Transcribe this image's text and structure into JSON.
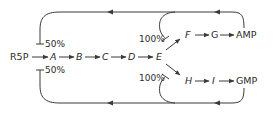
{
  "diagram": {
    "type": "metabolic-pathway-feedback",
    "colors": {
      "line": "#3a3a3a",
      "text": "#2a2a2a",
      "background": "#ffffff"
    },
    "nodes": {
      "r5p": "R5P",
      "a": "A",
      "b": "B",
      "c": "C",
      "d": "D",
      "e": "E",
      "f": "F",
      "g": "G",
      "amp": "AMP",
      "h": "H",
      "i": "I",
      "gmp": "GMP"
    },
    "labels": {
      "inhibit_a_top": "50%",
      "inhibit_a_bottom": "50%",
      "inhibit_f": "100%",
      "inhibit_h": "100%"
    },
    "edges": [
      {
        "from": "R5P",
        "to": "A"
      },
      {
        "from": "A",
        "to": "B"
      },
      {
        "from": "B",
        "to": "C"
      },
      {
        "from": "C",
        "to": "D"
      },
      {
        "from": "D",
        "to": "E"
      },
      {
        "from": "E",
        "to": "F"
      },
      {
        "from": "F",
        "to": "G"
      },
      {
        "from": "G",
        "to": "AMP"
      },
      {
        "from": "E",
        "to": "H"
      },
      {
        "from": "H",
        "to": "I"
      },
      {
        "from": "I",
        "to": "GMP"
      }
    ],
    "feedback": [
      {
        "from": "AMP",
        "to": "R5P→A",
        "type": "inhibition",
        "value": "50%"
      },
      {
        "from": "AMP",
        "to": "E→F",
        "type": "inhibition",
        "value": "100%"
      },
      {
        "from": "GMP",
        "to": "R5P→A",
        "type": "inhibition",
        "value": "50%"
      },
      {
        "from": "GMP",
        "to": "E→H",
        "type": "inhibition",
        "value": "100%"
      }
    ]
  }
}
